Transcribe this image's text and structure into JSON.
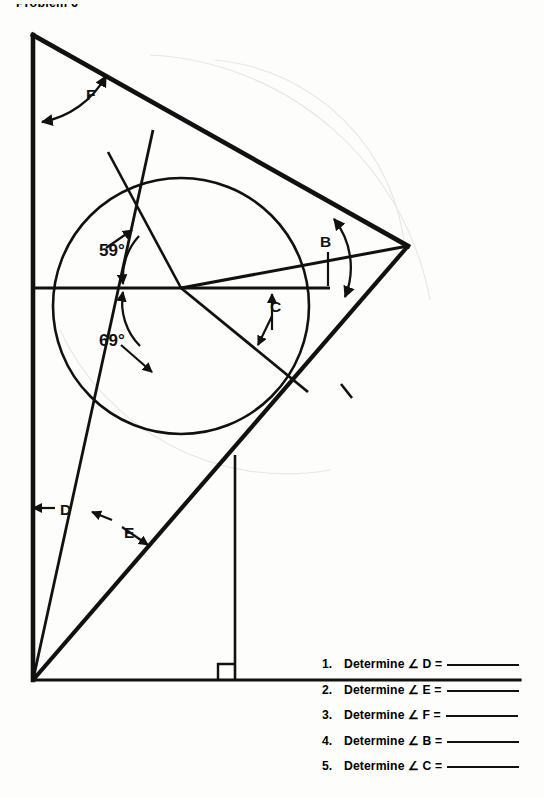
{
  "page": {
    "title": "Problem 6",
    "background": "#fdfdfb",
    "ink": "#111111"
  },
  "diagram": {
    "name": "triangle-circle-angle-construction",
    "labels": [
      {
        "id": "F",
        "text": "F",
        "x": 86,
        "y": 100
      },
      {
        "id": "a59",
        "text": "59°",
        "x": 99,
        "y": 250
      },
      {
        "id": "a69",
        "text": "69°",
        "x": 99,
        "y": 340
      },
      {
        "id": "B",
        "text": "B",
        "x": 326,
        "y": 241
      },
      {
        "id": "C",
        "text": "C",
        "x": 277,
        "y": 305
      },
      {
        "id": "D",
        "text": "D",
        "x": 60,
        "y": 510
      },
      {
        "id": "E",
        "text": "E",
        "x": 124,
        "y": 531
      }
    ],
    "angles_given": [
      {
        "label": "59°",
        "value": 59
      },
      {
        "label": "69°",
        "value": 69
      }
    ],
    "right_angle_marker": true,
    "circle": {
      "cx": 181,
      "cy": 306,
      "r": 128
    },
    "vertices": {
      "top_left": {
        "x": 33,
        "y": 35
      },
      "right": {
        "x": 408,
        "y": 246
      },
      "bottom_left": {
        "x": 33,
        "y": 680
      }
    }
  },
  "questions": {
    "items": [
      {
        "number": "1.",
        "text": "Determine ∠ D =",
        "answer": ""
      },
      {
        "number": "2.",
        "text": "Determine ∠ E =",
        "answer": ""
      },
      {
        "number": "3.",
        "text": "Determine ∠ F =",
        "answer": ""
      },
      {
        "number": "4.",
        "text": "Determine ∠ B =",
        "answer": ""
      },
      {
        "number": "5.",
        "text": "Determine ∠ C =",
        "answer": ""
      }
    ]
  }
}
